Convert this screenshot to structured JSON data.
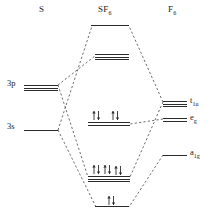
{
  "diagram": {
    "headers": [
      {
        "id": "left-header",
        "text": "S",
        "x": 39,
        "y": 4
      },
      {
        "id": "center-header",
        "text": "SF",
        "sub": "6",
        "x": 98,
        "y": 4
      },
      {
        "id": "right-header",
        "text": "F",
        "sub": "6",
        "x": 168,
        "y": 4
      }
    ],
    "left_levels": [
      {
        "id": "3p",
        "label": "3p",
        "label_x": 7,
        "label_y": 78,
        "x": 24,
        "y": 85,
        "width": 34,
        "degeneracy": 3,
        "spacing": 2.5
      },
      {
        "id": "3s",
        "label": "3s",
        "label_x": 7,
        "label_y": 121,
        "x": 24,
        "y": 130,
        "width": 34,
        "degeneracy": 1,
        "spacing": 0
      }
    ],
    "right_levels": [
      {
        "id": "t1u",
        "label": "t",
        "sub": "1u",
        "label_x": 190,
        "label_y": 95,
        "x": 163,
        "y": 101,
        "width": 24,
        "degeneracy": 3,
        "spacing": 2.5
      },
      {
        "id": "eg",
        "label": "e",
        "sub": "g",
        "label_x": 190,
        "label_y": 112,
        "x": 163,
        "y": 118,
        "width": 24,
        "degeneracy": 2,
        "spacing": 3
      },
      {
        "id": "a1g",
        "label": "a",
        "sub": "1g",
        "label_x": 190,
        "label_y": 147,
        "x": 163,
        "y": 155,
        "width": 24,
        "degeneracy": 1,
        "spacing": 0
      }
    ],
    "center_levels": [
      {
        "id": "a1g-star",
        "x": 91,
        "y": 25,
        "width": 38,
        "degeneracy": 1,
        "spacing": 0,
        "electrons": 0
      },
      {
        "id": "t1u-star",
        "x": 95,
        "y": 54,
        "width": 34,
        "degeneracy": 3,
        "spacing": 2.5,
        "electrons": 0
      },
      {
        "id": "nonbonding-eg",
        "x": 88,
        "y": 122,
        "width": 42,
        "degeneracy": 2,
        "spacing": 3,
        "electrons": 4
      },
      {
        "id": "t1u-bonding",
        "x": 88,
        "y": 176,
        "width": 42,
        "degeneracy": 3,
        "spacing": 2.5,
        "electrons": 6
      },
      {
        "id": "a1g-bonding",
        "x": 95,
        "y": 206,
        "width": 34,
        "degeneracy": 1,
        "spacing": 0,
        "electrons": 2
      }
    ],
    "electron_pairs": [
      {
        "id": "eg-e1",
        "x": 92,
        "y": 110
      },
      {
        "id": "eg-e2",
        "x": 111,
        "y": 110
      },
      {
        "id": "t1u-e1",
        "x": 92,
        "y": 164
      },
      {
        "id": "t1u-e2",
        "x": 103,
        "y": 164
      },
      {
        "id": "t1u-e3",
        "x": 114,
        "y": 165
      },
      {
        "id": "a1g-e1",
        "x": 107,
        "y": 195
      }
    ],
    "correlation_lines": [
      {
        "id": "s3p-to-t1u-star",
        "x1": 58,
        "y1": 85,
        "x2": 95,
        "y2": 56
      },
      {
        "id": "s3p-to-t1u-bonding",
        "x1": 58,
        "y1": 85,
        "x2": 88,
        "y2": 177
      },
      {
        "id": "s3s-to-a1g-star",
        "x1": 58,
        "y1": 130,
        "x2": 92,
        "y2": 26
      },
      {
        "id": "s3s-to-a1g-bonding",
        "x1": 58,
        "y1": 130,
        "x2": 96,
        "y2": 207
      },
      {
        "id": "f-t1u-to-t1u-star",
        "x1": 163,
        "y1": 102,
        "x2": 129,
        "y2": 26
      },
      {
        "id": "f-t1u-to-t1u-bonding",
        "x1": 163,
        "y1": 102,
        "x2": 130,
        "y2": 177
      },
      {
        "id": "f-a1g-to-a1g-bonding",
        "x1": 163,
        "y1": 155,
        "x2": 129,
        "y2": 207
      },
      {
        "id": "f-eg-to-nonbonding",
        "x1": 163,
        "y1": 119,
        "x2": 130,
        "y2": 124,
        "dashed_flat": true
      }
    ],
    "colors": {
      "ink": "#2b2b2b",
      "text": "#1a1a1a",
      "background": "#ffffff"
    }
  }
}
